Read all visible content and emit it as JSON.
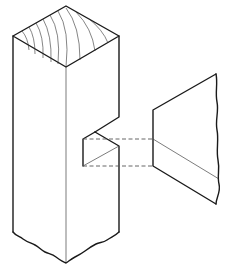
{
  "figure": {
    "title": "Isometric drawing of a post with a notch (housing) and a mating tapered tenon piece",
    "colors": {
      "background": "#ffffff",
      "line": "#1a1a1a",
      "thin_line": "#444444",
      "hidden_line": "#555555"
    },
    "parts": [
      {
        "name": "post",
        "description": "Square timber post with end grain visible on top, broken (wavy) bottom end"
      },
      {
        "name": "notch",
        "description": "Dovetail-style notch cut into the right edge of the post"
      },
      {
        "name": "tenon-piece",
        "description": "Tapered mating piece with broken (wavy) right end"
      },
      {
        "name": "hidden-lines",
        "description": "Two dashed projection lines connecting notch to mating piece"
      }
    ]
  }
}
